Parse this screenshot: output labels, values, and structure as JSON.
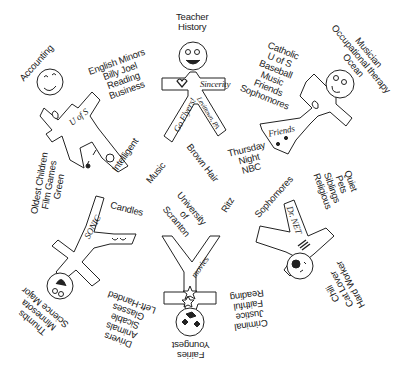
{
  "figures": [
    {
      "id": "figure-top-left",
      "badge": "U of S",
      "labels": {
        "head": [
          "Accounting"
        ],
        "arm": [
          "English Minors",
          "Billy Joel",
          "Reading",
          "Business"
        ]
      }
    },
    {
      "id": "figure-top-center",
      "badge": "Sincerity",
      "leg_left": "Go Flyers!",
      "leg_right": "Levittown, PA",
      "labels": {
        "head": [
          "Teacher",
          "History"
        ]
      }
    },
    {
      "id": "figure-top-right",
      "badge": "Friends",
      "labels": {
        "head": [
          "Musician",
          "Occupational therapy",
          "Ocean"
        ],
        "arm": [
          "Catholic",
          "U of S",
          "Baseball",
          "Music",
          "Friends",
          "Sophomores"
        ],
        "leg": [
          "Quiet",
          "Pets",
          "Siblings",
          "Religious"
        ]
      }
    },
    {
      "id": "figure-bottom-left",
      "badge": "SONIC",
      "labels": {
        "head": [
          "Thumbs",
          "Minnesota",
          "Science Major"
        ],
        "arm": [
          "Drivers",
          "Animals",
          "Sicable",
          "Glasses",
          "Left-Handed"
        ],
        "leg": [
          "Oldest Children",
          "Film Games",
          "Green"
        ]
      }
    },
    {
      "id": "figure-bottom-center",
      "badge": "movies",
      "labels": {
        "head": [
          "Fairies",
          "Youngest"
        ]
      }
    },
    {
      "id": "figure-bottom-right",
      "badge": "Dr. NET",
      "labels": {
        "head": [
          "Chili",
          "Cat Lover",
          "Hard Worker"
        ],
        "arm": [
          "Criminal",
          "Justice",
          "Faithful",
          "Reading"
        ]
      }
    }
  ],
  "shared": {
    "intelligent": "Intelligent",
    "candles": "Candles",
    "music": "Music",
    "brown_hair": "Brown Hair",
    "thursday": [
      "Thursday",
      "Night",
      "NBC"
    ],
    "university": [
      "University",
      "of",
      "Scranton"
    ],
    "ritz": "Ritz",
    "sophomores": "Sophomores"
  }
}
